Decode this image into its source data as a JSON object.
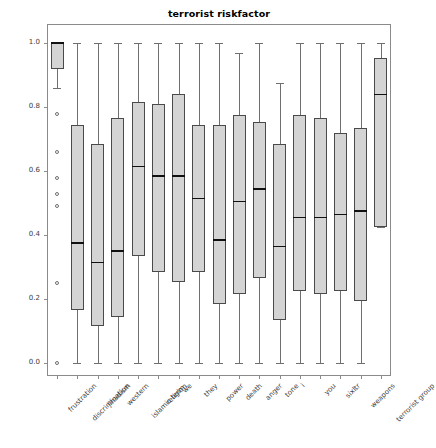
{
  "chart_data": {
    "type": "box",
    "title": "terrorist riskfactor",
    "xlabel": "",
    "ylabel": "indicator value",
    "ylim": [
      -0.04,
      1.06
    ],
    "yticks": [
      0.0,
      0.2,
      0.4,
      0.6,
      0.8,
      1.0
    ],
    "ytick_labels": [
      "0.0",
      "0.2",
      "0.4",
      "0.6",
      "0.8",
      "1.0"
    ],
    "grid": false,
    "legend": "none",
    "categories": [
      "frustration",
      "discrimination",
      "jihadism",
      "western",
      "islamic term.",
      "religion",
      "we",
      "they",
      "power",
      "death",
      "anger",
      "tone",
      "i",
      "you",
      "sixltr",
      "weapons",
      "terrorist group"
    ],
    "boxes": [
      {
        "label": "frustration",
        "whislo": 0.86,
        "q1": 0.92,
        "med": 1.0,
        "q3": 1.0,
        "whishi": 1.0,
        "fliers": [
          0.78,
          0.66,
          0.58,
          0.53,
          0.49,
          0.25,
          0.0
        ]
      },
      {
        "label": "discrimination",
        "whislo": 0.0,
        "q1": 0.165,
        "med": 0.375,
        "q3": 0.745,
        "whishi": 1.0,
        "fliers": []
      },
      {
        "label": "jihadism",
        "whislo": 0.0,
        "q1": 0.115,
        "med": 0.315,
        "q3": 0.685,
        "whishi": 1.0,
        "fliers": []
      },
      {
        "label": "western",
        "whislo": 0.0,
        "q1": 0.145,
        "med": 0.35,
        "q3": 0.765,
        "whishi": 1.0,
        "fliers": []
      },
      {
        "label": "islamic term.",
        "whislo": 0.0,
        "q1": 0.335,
        "med": 0.615,
        "q3": 0.815,
        "whishi": 1.0,
        "fliers": []
      },
      {
        "label": "religion",
        "whislo": 0.0,
        "q1": 0.285,
        "med": 0.585,
        "q3": 0.81,
        "whishi": 1.0,
        "fliers": []
      },
      {
        "label": "we",
        "whislo": 0.0,
        "q1": 0.255,
        "med": 0.585,
        "q3": 0.84,
        "whishi": 1.0,
        "fliers": []
      },
      {
        "label": "they",
        "whislo": 0.0,
        "q1": 0.285,
        "med": 0.515,
        "q3": 0.745,
        "whishi": 1.0,
        "fliers": []
      },
      {
        "label": "power",
        "whislo": 0.0,
        "q1": 0.185,
        "med": 0.385,
        "q3": 0.745,
        "whishi": 1.0,
        "fliers": []
      },
      {
        "label": "death",
        "whislo": 0.0,
        "q1": 0.215,
        "med": 0.505,
        "q3": 0.775,
        "whishi": 0.97,
        "fliers": []
      },
      {
        "label": "anger",
        "whislo": 0.0,
        "q1": 0.265,
        "med": 0.545,
        "q3": 0.755,
        "whishi": 1.0,
        "fliers": []
      },
      {
        "label": "tone",
        "whislo": 0.0,
        "q1": 0.135,
        "med": 0.365,
        "q3": 0.685,
        "whishi": 0.875,
        "fliers": []
      },
      {
        "label": "i",
        "whislo": 0.0,
        "q1": 0.225,
        "med": 0.455,
        "q3": 0.775,
        "whishi": 1.0,
        "fliers": []
      },
      {
        "label": "you",
        "whislo": 0.0,
        "q1": 0.215,
        "med": 0.455,
        "q3": 0.765,
        "whishi": 1.0,
        "fliers": []
      },
      {
        "label": "sixltr",
        "whislo": 0.0,
        "q1": 0.225,
        "med": 0.465,
        "q3": 0.72,
        "whishi": 1.0,
        "fliers": []
      },
      {
        "label": "weapons",
        "whislo": 0.0,
        "q1": 0.195,
        "med": 0.475,
        "q3": 0.735,
        "whishi": 1.0,
        "fliers": []
      },
      {
        "label": "terrorist group",
        "whislo": 0.425,
        "q1": 0.425,
        "med": 0.84,
        "q3": 0.955,
        "whishi": 1.0,
        "fliers": []
      }
    ],
    "colors": {
      "box_fill": "#d4d4d4",
      "box_edge": "#4a4a4a",
      "median": "#111111",
      "whisker": "#6f6f6f",
      "frame": "#8a8a8a",
      "text": "#000000",
      "tick_text": "#3c3c3c"
    }
  }
}
